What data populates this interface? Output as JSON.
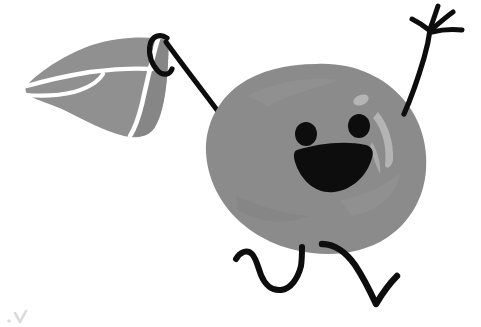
{
  "canvas": {
    "width": 481,
    "height": 327,
    "background": "#ffffff",
    "title": "Hand-drawn character flying a kite",
    "alt_text": "A grey blob-shaped cartoon character with a smiling face holds a string attached to a grey kite, one arm raised waving, two legs mid-stride."
  },
  "palette": {
    "background": "#ffffff",
    "body_grey": "#8b8b8b",
    "body_grey_light": "#9a9a9a",
    "body_highlight": "#b4b4b4",
    "kite_grey": "#909090",
    "kite_grey_dark": "#868686",
    "ink_black": "#0d0d0d",
    "white_line": "#ffffff",
    "watermark_grey": "#c9c9c9"
  },
  "objects": [
    {
      "id": "body",
      "name": "character-body",
      "label": "Character body",
      "shape": "irregular-blob",
      "fill": "#8b8b8b",
      "bbox": [
        205,
        64,
        222,
        190
      ],
      "center": [
        316,
        159
      ]
    },
    {
      "id": "left-eye",
      "name": "left-eye",
      "label": "Left eye",
      "shape": "ellipse",
      "fill": "#0d0d0d",
      "center": [
        306,
        134
      ],
      "radius": [
        11,
        12
      ]
    },
    {
      "id": "right-eye",
      "name": "right-eye",
      "label": "Right eye",
      "shape": "ellipse",
      "fill": "#0d0d0d",
      "center": [
        359,
        126
      ],
      "radius": [
        11,
        12
      ]
    },
    {
      "id": "mouth",
      "name": "smiling-mouth",
      "label": "Smiling open mouth",
      "shape": "half-moon",
      "fill": "#0d0d0d",
      "bbox": [
        296,
        145,
        78,
        48
      ]
    },
    {
      "id": "highlight-dot",
      "name": "body-highlight-dot",
      "label": "Body highlight dot",
      "shape": "ellipse",
      "fill": "#b4b4b4",
      "center": [
        361,
        100
      ],
      "radius": [
        8,
        5
      ]
    },
    {
      "id": "highlight-streak",
      "name": "body-highlight-streak",
      "label": "Body highlight streak",
      "shape": "crescent",
      "fill": "#b4b4b4",
      "bbox": [
        368,
        110,
        28,
        60
      ]
    },
    {
      "id": "kite",
      "name": "kite",
      "label": "Kite",
      "shape": "curved-sail",
      "fill": "#909090",
      "bbox": [
        24,
        33,
        145,
        105
      ],
      "panels": 3,
      "seam_color": "#ffffff"
    },
    {
      "id": "kite-string",
      "name": "kite-string",
      "label": "Kite string held by the character",
      "shape": "stroke",
      "stroke": "#0d0d0d",
      "stroke_width": 5,
      "from": [
        160,
        40
      ],
      "to": [
        242,
        147
      ],
      "has_hook_curl": true
    },
    {
      "id": "raised-arm",
      "name": "raised-arm",
      "label": "Raised right arm",
      "shape": "stroke",
      "stroke": "#0d0d0d",
      "stroke_width": 5,
      "from": [
        403,
        113
      ],
      "to": [
        428,
        25
      ]
    },
    {
      "id": "hand",
      "name": "waving-hand",
      "label": "Waving hand with four fingers",
      "shape": "strokes",
      "stroke": "#0d0d0d",
      "stroke_width": 5,
      "finger_count": 4,
      "palm": [
        428,
        27
      ]
    },
    {
      "id": "left-leg",
      "name": "left-leg",
      "label": "Left leg, squiggle stride",
      "shape": "stroke",
      "stroke": "#0d0d0d",
      "stroke_width": 6,
      "from": [
        236,
        257
      ],
      "to": [
        302,
        248
      ]
    },
    {
      "id": "right-leg",
      "name": "right-leg",
      "label": "Right leg, kicked back with foot",
      "shape": "stroke",
      "stroke": "#0d0d0d",
      "stroke_width": 6,
      "from": [
        322,
        243
      ],
      "to": [
        397,
        277
      ]
    },
    {
      "id": "watermark",
      "name": "corner-watermark",
      "label": "Faint grey mark in lower-left corner",
      "shape": "tick",
      "fill": "#c9c9c9",
      "bbox": [
        10,
        311,
        18,
        12
      ]
    }
  ]
}
